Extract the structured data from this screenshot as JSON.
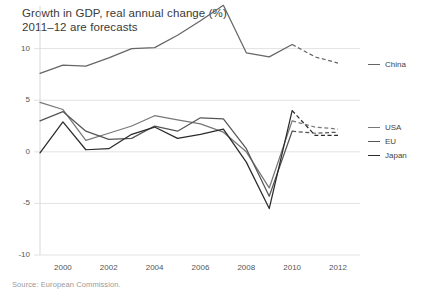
{
  "chart_data": {
    "type": "line",
    "title": "Growth in GDP, real annual change (%)",
    "subtitle": "2011–12 are forecasts",
    "xlabel": "",
    "ylabel": "",
    "xlim": [
      1999,
      2012
    ],
    "ylim": [
      -10,
      12
    ],
    "grid": true,
    "legend_position": "right",
    "source": "Source: European Commission.",
    "ytick_labels": [
      "10",
      "5",
      "0",
      "-5",
      "-10"
    ],
    "ytick_values": [
      10,
      5,
      0,
      -5,
      -10
    ],
    "xtick_labels": [
      "2000",
      "2002",
      "2004",
      "2006",
      "2008",
      "2010",
      "2012"
    ],
    "xtick_values": [
      2000,
      2002,
      2004,
      2006,
      2008,
      2010,
      2012
    ],
    "x": [
      1999,
      2000,
      2001,
      2002,
      2003,
      2004,
      2005,
      2006,
      2007,
      2008,
      2009,
      2010,
      2011,
      2012
    ],
    "forecast_from": 2010,
    "series": [
      {
        "name": "China",
        "color": "#666666",
        "values": [
          7.6,
          8.4,
          8.3,
          9.1,
          10.0,
          10.1,
          11.3,
          12.7,
          14.2,
          9.6,
          9.2,
          10.4,
          9.2,
          8.6
        ]
      },
      {
        "name": "USA",
        "color": "#777777",
        "values": [
          4.8,
          4.1,
          1.1,
          1.8,
          2.5,
          3.5,
          3.1,
          2.7,
          1.9,
          0.0,
          -3.5,
          3.0,
          2.4,
          2.2
        ]
      },
      {
        "name": "EU",
        "color": "#555555",
        "values": [
          3.0,
          3.9,
          2.0,
          1.2,
          1.3,
          2.5,
          2.0,
          3.3,
          3.2,
          0.3,
          -4.3,
          2.0,
          1.8,
          1.9
        ]
      },
      {
        "name": "Japan",
        "color": "#2b2b2b",
        "values": [
          -0.1,
          2.9,
          0.2,
          0.3,
          1.7,
          2.4,
          1.3,
          1.7,
          2.2,
          -1.0,
          -5.5,
          4.0,
          1.6,
          1.6
        ]
      }
    ]
  },
  "legend": {
    "items": [
      {
        "label": "China"
      },
      {
        "label": "USA"
      },
      {
        "label": "EU"
      },
      {
        "label": "Japan"
      }
    ]
  },
  "footer": {
    "source": "Source: European Commission."
  }
}
